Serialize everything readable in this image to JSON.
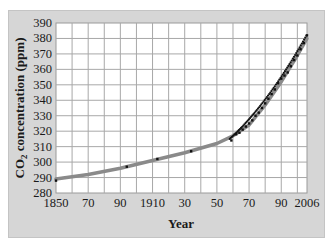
{
  "chart_data": {
    "type": "scatter",
    "title": "",
    "xlabel": "Year",
    "ylabel": "CO2 concentration (ppm)",
    "xlim": [
      1850,
      2006
    ],
    "ylim": [
      280,
      390
    ],
    "x_ticks": [
      1850,
      1870,
      1890,
      1910,
      1930,
      1950,
      1970,
      1990,
      2006
    ],
    "x_tick_labels": [
      "1850",
      "70",
      "90",
      "1910",
      "30",
      "50",
      "70",
      "90",
      "2006"
    ],
    "y_ticks": [
      280,
      290,
      300,
      310,
      320,
      330,
      340,
      350,
      360,
      370,
      380,
      390
    ],
    "grid": true,
    "series": [
      {
        "name": "Measurements",
        "style": "points",
        "color": "#111111",
        "x": [
          1850,
          1894,
          1913,
          1934,
          1959,
          1962,
          1964,
          1966,
          1968,
          1970,
          1972,
          1974,
          1976,
          1978,
          1980,
          1982,
          1984,
          1986,
          1988,
          1990,
          1992,
          1994,
          1996,
          1998,
          2000,
          2002,
          2004,
          2006
        ],
        "y": [
          288,
          297,
          302,
          307,
          314,
          318,
          319,
          321,
          323,
          325,
          327,
          330,
          332,
          335,
          338,
          341,
          344,
          347,
          351,
          354,
          356,
          358,
          362,
          366,
          369,
          373,
          377,
          382
        ]
      },
      {
        "name": "Fitted curve",
        "style": "line",
        "color": "#8a8a8a",
        "x": [
          1850,
          1870,
          1890,
          1910,
          1930,
          1950,
          1960,
          1970,
          1980,
          1990,
          2000,
          2006
        ],
        "y": [
          289,
          292,
          296,
          301,
          306,
          312,
          317,
          324,
          337,
          352,
          369,
          380
        ]
      }
    ]
  },
  "labels": {
    "xlabel": "Year",
    "ylabel_prefix": "CO",
    "ylabel_sub": "2",
    "ylabel_suffix": " concentration (ppm)"
  }
}
